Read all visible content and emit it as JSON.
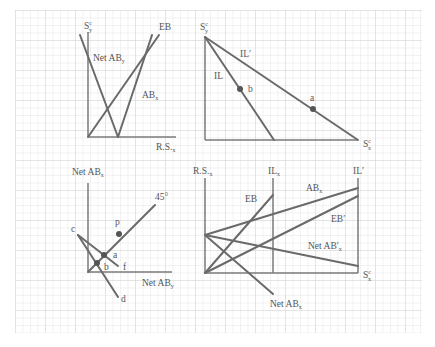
{
  "figure": {
    "background": "#ffffff",
    "grid_color": "#e4e4e4",
    "line_color": "#6a6a6a",
    "panels": [
      {
        "id": "top-left",
        "labels": {
          "y_axis": "S",
          "y_axis_sup": "c",
          "y_axis_sub": "y",
          "eb": "EB",
          "net_ab": "Net AB",
          "net_ab_sub": "y",
          "ab": "AB",
          "ab_sub": "x",
          "x_axis": "R.S.",
          "x_axis_sub": "x"
        }
      },
      {
        "id": "top-right",
        "labels": {
          "y_axis": "S",
          "y_axis_sup": "c",
          "y_axis_sub": "y",
          "il_prime": "IL′",
          "il": "IL",
          "point_b": "b",
          "point_a": "a",
          "x_axis": "S",
          "x_axis_sup": "c",
          "x_axis_sub": "x"
        }
      },
      {
        "id": "bottom-left",
        "labels": {
          "y_axis": "Net AB",
          "y_axis_sub": "x",
          "angle": "45°",
          "point_p": "p",
          "point_c": "c",
          "point_a": "a",
          "point_b": "b",
          "point_f": "f",
          "point_d": "d",
          "x_axis": "Net AB",
          "x_axis_sub": "y"
        }
      },
      {
        "id": "bottom-right",
        "labels": {
          "y_axis": "R.S.",
          "y_axis_sub": "x",
          "il": "IL",
          "il_sub": "x",
          "il_prime": "IL′",
          "eb": "EB",
          "ab": "AB",
          "ab_sub": "x",
          "eb_prime": "EB′",
          "net_ab_prime": "Net AB′",
          "net_ab_prime_sub": "x",
          "net_ab": "Net AB",
          "net_ab_sub": "x",
          "x_axis": "S",
          "x_axis_sup": "c",
          "x_axis_sub": "x"
        }
      }
    ]
  }
}
